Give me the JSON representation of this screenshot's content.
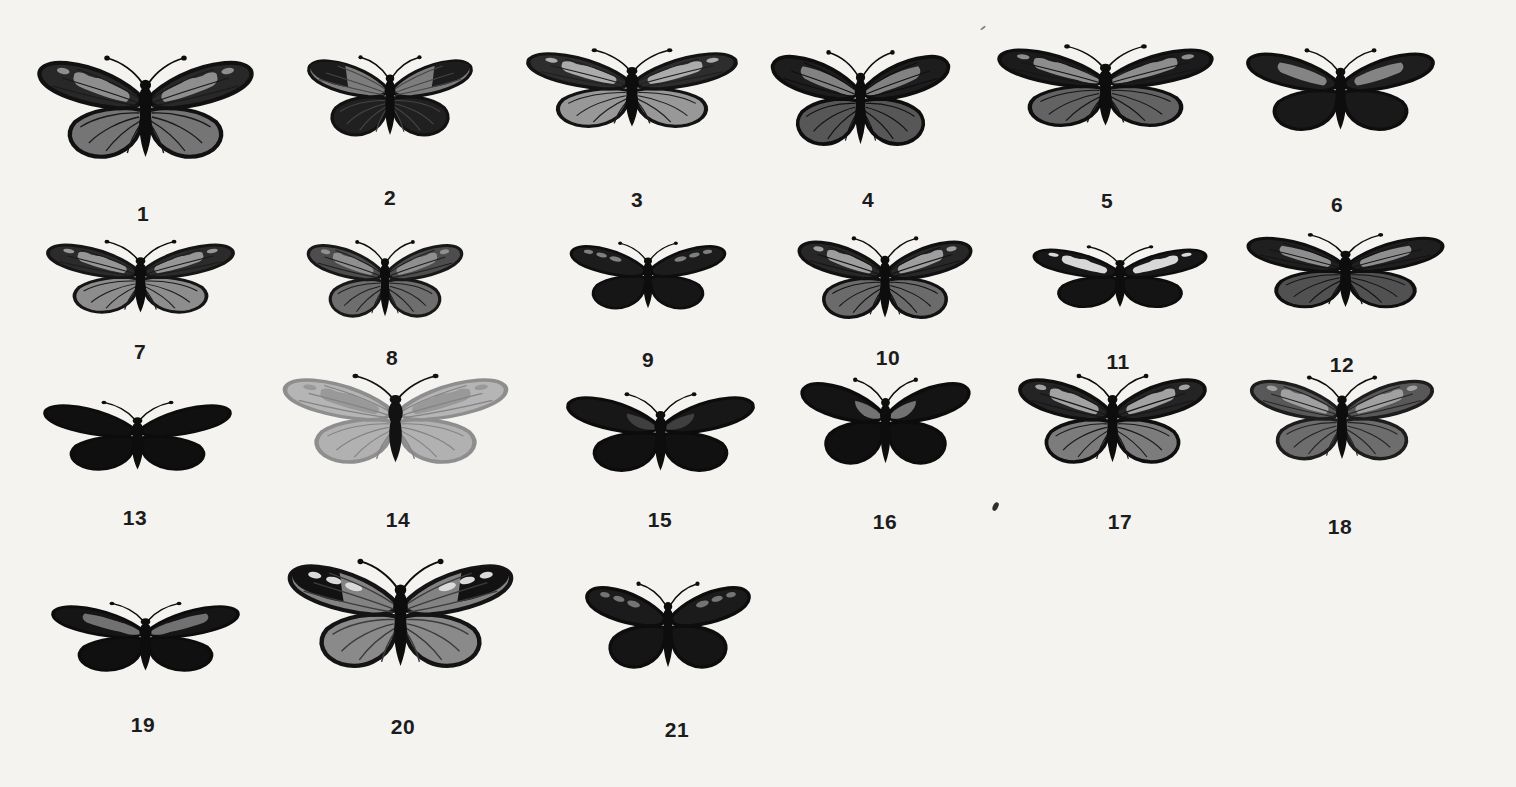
{
  "plate": {
    "background": "#f4f3f0",
    "label_color": "#1c1c1c",
    "rows": 4,
    "specimen_count": 21
  },
  "specimens": [
    {
      "number": "1",
      "cx": 145,
      "cy": 120,
      "w": 235,
      "h": 140,
      "lx": 143,
      "ly": 202,
      "colors": {
        "body": "#0d0d0d",
        "fw": "#282828",
        "hw": "#757575",
        "apex": "none",
        "band": "#8e8e8e",
        "spots": "#8e8e8e",
        "basal": "none",
        "vein": "#1a1a1a",
        "edge": "#111111"
      }
    },
    {
      "number": "2",
      "cx": 390,
      "cy": 106,
      "w": 180,
      "h": 110,
      "lx": 390,
      "ly": 186,
      "colors": {
        "body": "#0d0d0d",
        "fw": "#7d7d7d",
        "hw": "#202020",
        "apex": "#1c1c1c",
        "band": "none",
        "spots": "none",
        "basal": "none",
        "vein": "#454545",
        "edge": "#121212"
      }
    },
    {
      "number": "3",
      "cx": 632,
      "cy": 98,
      "w": 230,
      "h": 108,
      "lx": 637,
      "ly": 188,
      "colors": {
        "body": "#0d0d0d",
        "fw": "#2d2d2d",
        "hw": "#989898",
        "apex": "none",
        "band": "#ababab",
        "spots": "#ababab",
        "basal": "none",
        "vein": "#1f1f1f",
        "edge": "#131313"
      }
    },
    {
      "number": "4",
      "cx": 860,
      "cy": 110,
      "w": 195,
      "h": 130,
      "lx": 868,
      "ly": 188,
      "colors": {
        "body": "#0d0d0d",
        "fw": "#1d1d1d",
        "hw": "#575757",
        "apex": "none",
        "band": "#828282",
        "spots": "none",
        "basal": "#828282",
        "vein": "#101010",
        "edge": "#0e0e0e"
      }
    },
    {
      "number": "5",
      "cx": 1105,
      "cy": 96,
      "w": 235,
      "h": 112,
      "lx": 1107,
      "ly": 189,
      "colors": {
        "body": "#0d0d0d",
        "fw": "#1b1b1b",
        "hw": "#636363",
        "apex": "none",
        "band": "#8d8d8d",
        "spots": "#8d8d8d",
        "basal": "#8d8d8d",
        "vein": "#161616",
        "edge": "#0f0f0f"
      }
    },
    {
      "number": "6",
      "cx": 1340,
      "cy": 100,
      "w": 205,
      "h": 112,
      "lx": 1337,
      "ly": 193,
      "colors": {
        "body": "#0d0d0d",
        "fw": "#1e1e1e",
        "hw": "#191919",
        "apex": "none",
        "band": "#848484",
        "spots": "none",
        "basal": "none",
        "vein": "none",
        "edge": "#0e0e0e"
      }
    },
    {
      "number": "7",
      "cx": 140,
      "cy": 286,
      "w": 205,
      "h": 100,
      "lx": 140,
      "ly": 340,
      "colors": {
        "body": "#0d0d0d",
        "fw": "#2b2b2b",
        "hw": "#8d8d8d",
        "apex": "none",
        "band": "#969696",
        "spots": "#969696",
        "basal": "none",
        "vein": "#1c1c1c",
        "edge": "#151515"
      }
    },
    {
      "number": "8",
      "cx": 385,
      "cy": 288,
      "w": 170,
      "h": 105,
      "lx": 392,
      "ly": 346,
      "colors": {
        "body": "#0d0d0d",
        "fw": "#4d4d4d",
        "hw": "#6e6e6e",
        "apex": "none",
        "band": "#8f8f8f",
        "spots": "#8f8f8f",
        "basal": "none",
        "vein": "#1e1e1e",
        "edge": "#181818"
      }
    },
    {
      "number": "9",
      "cx": 648,
      "cy": 284,
      "w": 170,
      "h": 92,
      "lx": 648,
      "ly": 348,
      "colors": {
        "body": "#0d0d0d",
        "fw": "#1c1c1c",
        "hw": "#161616",
        "apex": "none",
        "band": "none",
        "spots": "#7f7f7f",
        "basal": "none",
        "vein": "none",
        "edge": "#0e0e0e"
      }
    },
    {
      "number": "10",
      "cx": 885,
      "cy": 288,
      "w": 190,
      "h": 112,
      "lx": 888,
      "ly": 346,
      "colors": {
        "body": "#0d0d0d",
        "fw": "#272727",
        "hw": "#6b6b6b",
        "apex": "none",
        "band": "#9e9e9e",
        "spots": "#9e9e9e",
        "basal": "none",
        "vein": "#141414",
        "edge": "#111111"
      }
    },
    {
      "number": "11",
      "cx": 1120,
      "cy": 284,
      "w": 190,
      "h": 85,
      "lx": 1118,
      "ly": 350,
      "colors": {
        "body": "#0d0d0d",
        "fw": "#171717",
        "hw": "#141414",
        "apex": "none",
        "band": "#d8d8d8",
        "spots": "#d8d8d8",
        "basal": "none",
        "vein": "none",
        "edge": "#0d0d0d"
      }
    },
    {
      "number": "12",
      "cx": 1345,
      "cy": 280,
      "w": 215,
      "h": 102,
      "lx": 1342,
      "ly": 353,
      "colors": {
        "body": "#0d0d0d",
        "fw": "#1f1f1f",
        "hw": "#515151",
        "apex": "none",
        "band": "#8e8e8e",
        "spots": "none",
        "basal": "none",
        "vein": "#131313",
        "edge": "#0f0f0f"
      }
    },
    {
      "number": "13",
      "cx": 137,
      "cy": 444,
      "w": 205,
      "h": 95,
      "lx": 135,
      "ly": 506,
      "colors": {
        "body": "#0d0d0d",
        "fw": "#101010",
        "hw": "#0f0f0f",
        "apex": "none",
        "band": "none",
        "spots": "none",
        "basal": "none",
        "vein": "none",
        "edge": "#0c0c0c"
      }
    },
    {
      "number": "14",
      "cx": 395,
      "cy": 430,
      "w": 245,
      "h": 122,
      "lx": 398,
      "ly": 508,
      "colors": {
        "body": "#121212",
        "fw": "#b5b5b5",
        "hw": "#b1b1b1",
        "apex": "none",
        "band": "#999999",
        "spots": "#999999",
        "basal": "none",
        "vein": "#848484",
        "edge": "#8e8e8e"
      }
    },
    {
      "number": "15",
      "cx": 660,
      "cy": 442,
      "w": 205,
      "h": 108,
      "lx": 660,
      "ly": 508,
      "colors": {
        "body": "#0d0d0d",
        "fw": "#171717",
        "hw": "#111111",
        "apex": "none",
        "band": "none",
        "spots": "none",
        "basal": "#3f3f3f",
        "vein": "none",
        "edge": "#0c0c0c"
      }
    },
    {
      "number": "16",
      "cx": 885,
      "cy": 432,
      "w": 185,
      "h": 118,
      "lx": 885,
      "ly": 510,
      "colors": {
        "body": "#0d0d0d",
        "fw": "#141414",
        "hw": "#101010",
        "apex": "none",
        "band": "none",
        "spots": "none",
        "basal": "#737373",
        "vein": "none",
        "edge": "#0c0c0c"
      }
    },
    {
      "number": "17",
      "cx": 1112,
      "cy": 430,
      "w": 205,
      "h": 122,
      "lx": 1120,
      "ly": 510,
      "colors": {
        "body": "#0d0d0d",
        "fw": "#242424",
        "hw": "#7c7c7c",
        "apex": "none",
        "band": "#a2a2a2",
        "spots": "#a2a2a2",
        "basal": "none",
        "vein": "#181818",
        "edge": "#0f0f0f"
      }
    },
    {
      "number": "18",
      "cx": 1342,
      "cy": 428,
      "w": 200,
      "h": 115,
      "lx": 1340,
      "ly": 515,
      "colors": {
        "body": "#0d0d0d",
        "fw": "#585858",
        "hw": "#6d6d6d",
        "apex": "none",
        "band": "#a0a0a0",
        "spots": "#a0a0a0",
        "basal": "none",
        "vein": "#242424",
        "edge": "#1d1d1d"
      }
    },
    {
      "number": "19",
      "cx": 145,
      "cy": 645,
      "w": 205,
      "h": 95,
      "lx": 143,
      "ly": 713,
      "colors": {
        "body": "#0d0d0d",
        "fw": "#151515",
        "hw": "#101010",
        "apex": "none",
        "band": "#717171",
        "spots": "none",
        "basal": "#717171",
        "vein": "none",
        "edge": "#0c0c0c"
      }
    },
    {
      "number": "20",
      "cx": 400,
      "cy": 627,
      "w": 245,
      "h": 148,
      "lx": 403,
      "ly": 715,
      "colors": {
        "body": "#0d0d0d",
        "fw": "#838383",
        "hw": "#8a8a8a",
        "apex": "#121212",
        "band": "none",
        "spots": "#dadada",
        "basal": "none",
        "vein": "#3c3c3c",
        "edge": "#141414"
      }
    },
    {
      "number": "21",
      "cx": 668,
      "cy": 636,
      "w": 180,
      "h": 118,
      "lx": 677,
      "ly": 718,
      "colors": {
        "body": "#0d0d0d",
        "fw": "#1b1b1b",
        "hw": "#151515",
        "apex": "none",
        "band": "none",
        "spots": "#747474",
        "basal": "none",
        "vein": "none",
        "edge": "#0d0d0d"
      }
    }
  ],
  "marks": [
    {
      "x": 993,
      "y": 502
    },
    {
      "x": 980,
      "y": 27
    }
  ]
}
